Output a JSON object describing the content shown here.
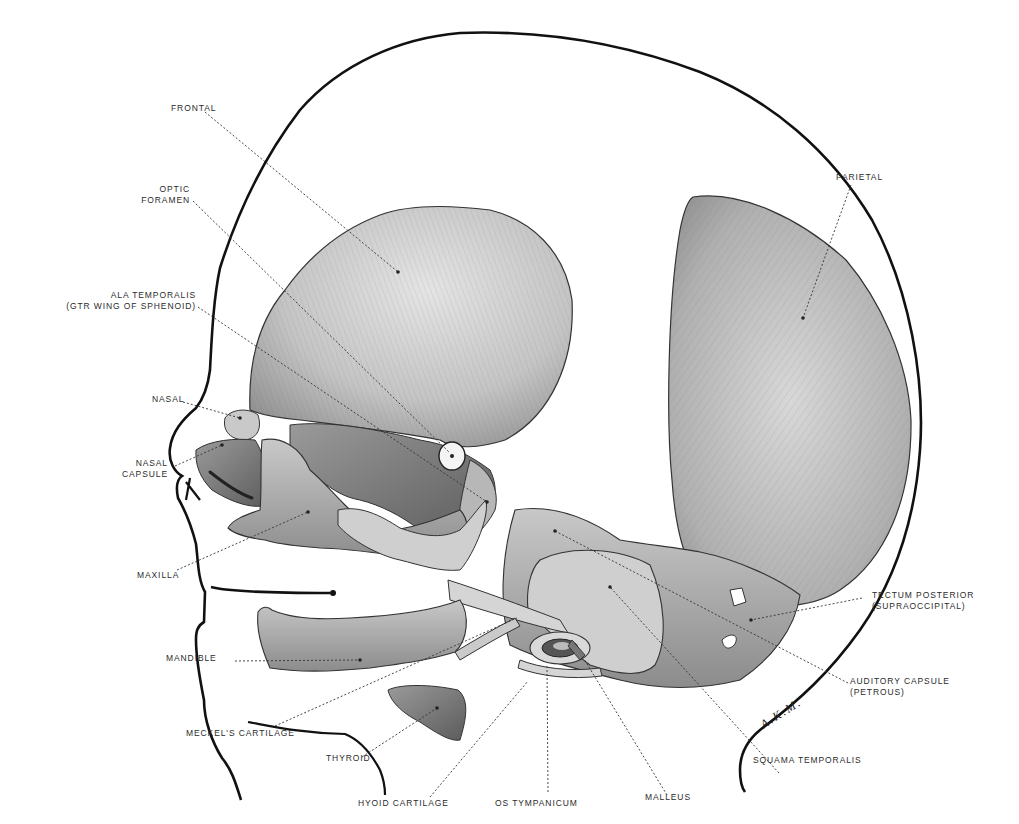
{
  "figure": {
    "type": "anatomical-illustration",
    "signature": "A.K.M.",
    "colors": {
      "outline": "#111111",
      "bone_light": "#d9d9d9",
      "bone_mid": "#a8a8a8",
      "bone_dark": "#6e6e6e",
      "leader": "#333333"
    }
  },
  "labels": {
    "frontal": "FRONTAL",
    "optic_foramen": [
      "OPTIC",
      "FORAMEN"
    ],
    "ala_temporalis": [
      "ALA TEMPORALIS",
      "(GTR WING OF SPHENOID)"
    ],
    "nasal": "NASAL",
    "nasal_capsule": [
      "NASAL",
      "CAPSULE"
    ],
    "maxilla": "MAXILLA",
    "mandible": "MANDIBLE",
    "meckels_cartilage": "MECKEL'S CARTILAGE",
    "thyroid": "THYROID",
    "hyoid_cartilage": "HYOID CARTILAGE",
    "os_tympanicum": "OS TYMPANICUM",
    "malleus": "MALLEUS",
    "squama_temporalis": "SQUAMA TEMPORALIS",
    "auditory_capsule": [
      "AUDITORY CAPSULE",
      "(PETROUS)"
    ],
    "tectum_posterior": [
      "TECTUM POSTERIOR",
      "(SUPRAOCCIPITAL)"
    ],
    "parietal": "PARIETAL"
  }
}
